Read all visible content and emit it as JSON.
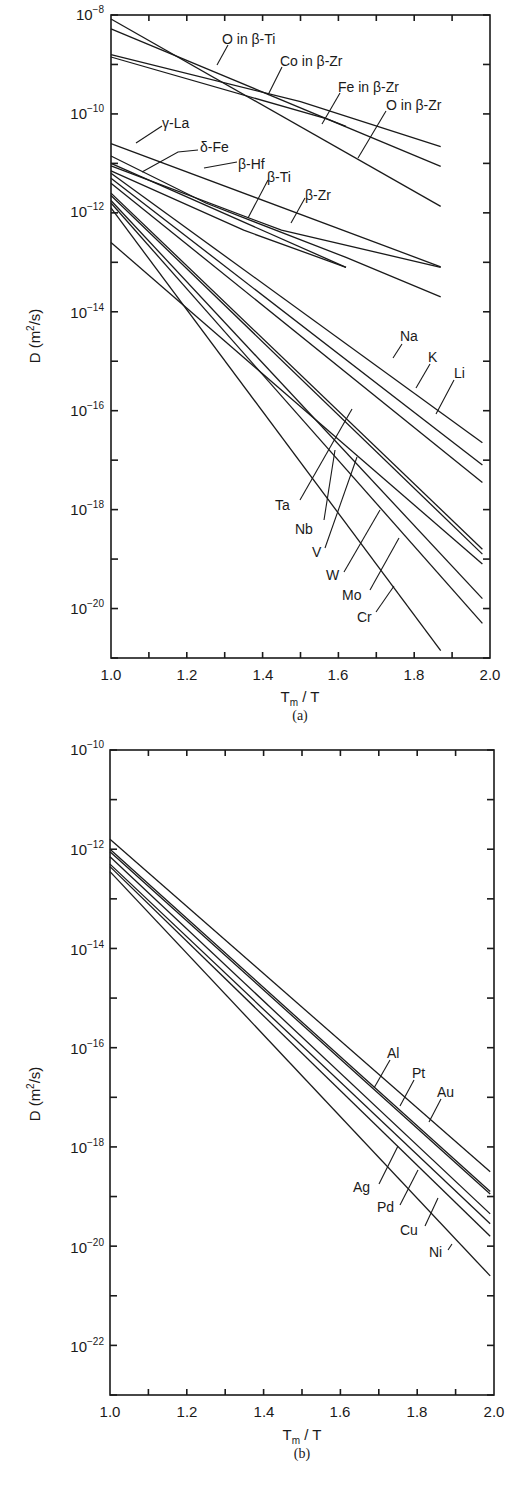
{
  "chart_data": [
    {
      "id": "a",
      "type": "line",
      "title": "",
      "caption": "(a)",
      "xlabel": "T_m / T",
      "ylabel": "D (m²/s)",
      "xscale": "linear",
      "yscale": "log",
      "xlim": [
        1.0,
        2.0
      ],
      "ylim_log10": [
        -21,
        -8
      ],
      "xticks": [
        "1.0",
        "1.2",
        "1.4",
        "1.6",
        "1.8",
        "2.0"
      ],
      "yticks": [
        "10^-8",
        "10^-10",
        "10^-12",
        "10^-14",
        "10^-16",
        "10^-18",
        "10^-20"
      ],
      "grid": false,
      "legend": "inline leader-line labels",
      "series": [
        {
          "name": "O in β-Ti",
          "points_log10": [
            [
              1.0,
              -8.08
            ],
            [
              1.87,
              -11.87
            ]
          ]
        },
        {
          "name": "Co in β-Zr",
          "points_log10": [
            [
              1.0,
              -8.28
            ],
            [
              1.87,
              -11.06
            ]
          ]
        },
        {
          "name": "Fe in β-Zr",
          "points_log10": [
            [
              1.0,
              -8.8
            ],
            [
              1.5,
              -9.75
            ],
            [
              1.87,
              -10.66
            ]
          ]
        },
        {
          "name": "O in β-Zr",
          "points_log10": [
            [
              1.0,
              -8.85
            ],
            [
              1.57,
              -10.1
            ],
            [
              1.62,
              -10.25
            ]
          ]
        },
        {
          "name": "γ-La",
          "points_log10": [
            [
              1.0,
              -10.6
            ],
            [
              1.87,
              -13.09
            ]
          ]
        },
        {
          "name": "δ-Fe",
          "points_log10": [
            [
              1.0,
              -11.0
            ],
            [
              1.62,
              -13.1
            ]
          ]
        },
        {
          "name": "β-Hf",
          "points_log10": [
            [
              1.0,
              -10.85
            ],
            [
              1.25,
              -11.8
            ],
            [
              1.62,
              -12.9
            ],
            [
              1.87,
              -13.7
            ]
          ]
        },
        {
          "name": "β-Ti",
          "points_log10": [
            [
              1.0,
              -11.15
            ],
            [
              1.35,
              -12.35
            ],
            [
              1.62,
              -13.1
            ]
          ]
        },
        {
          "name": "β-Zr",
          "points_log10": [
            [
              1.0,
              -11.05
            ],
            [
              1.45,
              -12.35
            ],
            [
              1.87,
              -13.1
            ]
          ]
        },
        {
          "name": "Na",
          "points_log10": [
            [
              1.0,
              -11.2
            ],
            [
              1.98,
              -16.65
            ]
          ]
        },
        {
          "name": "K",
          "points_log10": [
            [
              1.0,
              -11.3
            ],
            [
              1.98,
              -17.1
            ]
          ]
        },
        {
          "name": "Li",
          "points_log10": [
            [
              1.0,
              -11.4
            ],
            [
              1.98,
              -17.45
            ]
          ]
        },
        {
          "name": "Ta",
          "points_log10": [
            [
              1.0,
              -12.6
            ],
            [
              1.98,
              -19.1
            ]
          ]
        },
        {
          "name": "Nb",
          "points_log10": [
            [
              1.0,
              -11.6
            ],
            [
              1.98,
              -18.8
            ]
          ]
        },
        {
          "name": "V",
          "points_log10": [
            [
              1.0,
              -11.65
            ],
            [
              1.98,
              -18.9
            ]
          ]
        },
        {
          "name": "W",
          "points_log10": [
            [
              1.0,
              -11.75
            ],
            [
              1.98,
              -19.8
            ]
          ]
        },
        {
          "name": "Mo",
          "points_log10": [
            [
              1.0,
              -11.8
            ],
            [
              1.98,
              -20.3
            ]
          ]
        },
        {
          "name": "Cr",
          "points_log10": [
            [
              1.0,
              -11.9
            ],
            [
              1.87,
              -20.85
            ]
          ]
        }
      ]
    },
    {
      "id": "b",
      "type": "line",
      "title": "",
      "caption": "(b)",
      "xlabel": "T_m / T",
      "ylabel": "D (m²/s)",
      "xscale": "linear",
      "yscale": "log",
      "xlim": [
        1.0,
        2.0
      ],
      "ylim_log10": [
        -23,
        -10
      ],
      "xticks": [
        "1.0",
        "1.2",
        "1.4",
        "1.6",
        "1.8",
        "2.0"
      ],
      "yticks": [
        "10^-10",
        "10^-12",
        "10^-14",
        "10^-16",
        "10^-18",
        "10^-20",
        "10^-22"
      ],
      "grid": false,
      "legend": "inline leader-line labels",
      "series": [
        {
          "name": "Al",
          "points_log10": [
            [
              1.0,
              -11.8
            ],
            [
              1.99,
              -18.5
            ]
          ]
        },
        {
          "name": "Pt",
          "points_log10": [
            [
              1.0,
              -12.0
            ],
            [
              1.99,
              -18.9
            ]
          ]
        },
        {
          "name": "Au",
          "points_log10": [
            [
              1.0,
              -12.05
            ],
            [
              1.99,
              -18.95
            ]
          ]
        },
        {
          "name": "Ag",
          "points_log10": [
            [
              1.0,
              -12.15
            ],
            [
              1.99,
              -19.35
            ]
          ]
        },
        {
          "name": "Pd",
          "points_log10": [
            [
              1.0,
              -12.3
            ],
            [
              1.99,
              -19.55
            ]
          ]
        },
        {
          "name": "Cu",
          "points_log10": [
            [
              1.0,
              -12.35
            ],
            [
              1.99,
              -19.8
            ]
          ]
        },
        {
          "name": "Ni",
          "points_log10": [
            [
              1.0,
              -12.45
            ],
            [
              1.99,
              -20.6
            ]
          ]
        }
      ]
    }
  ],
  "charts": {
    "a": {
      "ylabel": "D (m",
      "ylabel_sup": "2",
      "ylabel_tail": "/s)",
      "xlabel_main": "T",
      "xlabel_sub": "m",
      "xlabel_tail": " / T",
      "caption": "(a)",
      "ytick_base": "10",
      "ytick_exps": [
        "−8",
        "−10",
        "−12",
        "−14",
        "−16",
        "−18",
        "−20"
      ],
      "xticks": [
        "1.0",
        "1.2",
        "1.4",
        "1.6",
        "1.8",
        "2.0"
      ],
      "labels": {
        "o_in_beta_ti": "O in β-Ti",
        "co_in_beta_zr": "Co in β-Zr",
        "fe_in_beta_zr": "Fe in β-Zr",
        "o_in_beta_zr": "O in β-Zr",
        "gamma_la": "γ-La",
        "delta_fe": "δ-Fe",
        "beta_hf": "β-Hf",
        "beta_ti": "β-Ti",
        "beta_zr": "β-Zr",
        "na": "Na",
        "k": "K",
        "li": "Li",
        "ta": "Ta",
        "nb": "Nb",
        "v": "V",
        "w": "W",
        "mo": "Mo",
        "cr": "Cr"
      }
    },
    "b": {
      "ylabel": "D (m",
      "ylabel_sup": "2",
      "ylabel_tail": "/s)",
      "xlabel_main": "T",
      "xlabel_sub": "m",
      "xlabel_tail": " / T",
      "caption": "(b)",
      "ytick_base": "10",
      "ytick_exps": [
        "−10",
        "−12",
        "−14",
        "−16",
        "−18",
        "−20",
        "−22"
      ],
      "xticks": [
        "1.0",
        "1.2",
        "1.4",
        "1.6",
        "1.8",
        "2.0"
      ],
      "labels": {
        "al": "Al",
        "pt": "Pt",
        "au": "Au",
        "ag": "Ag",
        "pd": "Pd",
        "cu": "Cu",
        "ni": "Ni"
      }
    }
  },
  "colors": {
    "ink": "#1a1a1a",
    "background": "#ffffff"
  }
}
